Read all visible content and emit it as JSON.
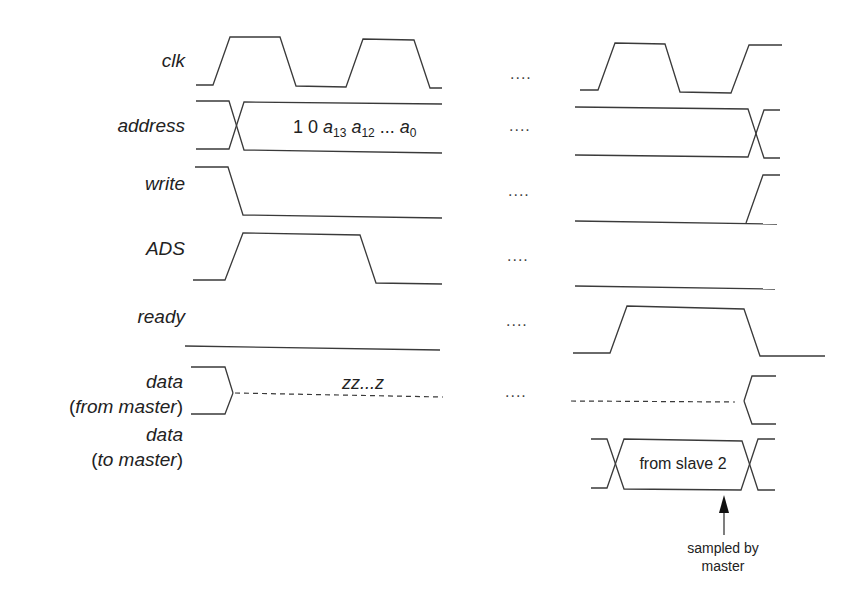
{
  "diagram": {
    "type": "timing-diagram",
    "signals": [
      {
        "id": "clk",
        "label": "clk",
        "label_y": 67
      },
      {
        "id": "address",
        "label": "address",
        "label_y": 132
      },
      {
        "id": "write",
        "label": "write",
        "label_y": 190
      },
      {
        "id": "ads",
        "label": "ADS",
        "label_y": 255
      },
      {
        "id": "ready",
        "label": "ready",
        "label_y": 323
      },
      {
        "id": "data_from_master",
        "label": "data",
        "label2": "(from master)",
        "label_y": 388,
        "label2_y": 413
      },
      {
        "id": "data_to_master",
        "label": "data",
        "label2": "(to master)",
        "label_y": 441,
        "label2_y": 466
      }
    ],
    "address_value": {
      "prefix": "1 0 ",
      "a13": "a",
      "a13_sub": "13",
      "a12": "a",
      "a12_sub": "12",
      "ellipsis": " ... ",
      "a0": "a",
      "a0_sub": "0"
    },
    "high_z_label": "zz...z",
    "continuation": "....",
    "slave_box_label": "from slave 2",
    "annotation": {
      "line1": "sampled by",
      "line2": "master"
    },
    "stroke_color": "#3a3a3a"
  }
}
